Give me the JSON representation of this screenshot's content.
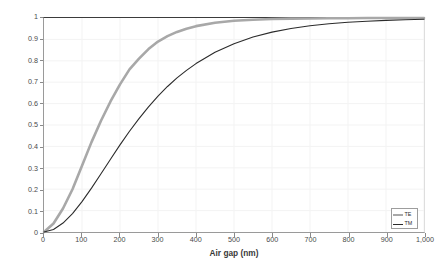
{
  "chart_data": {
    "type": "line",
    "title": "",
    "xlabel": "Air gap (nm)",
    "ylabel": "Reflection coefficient R",
    "xlim": [
      0,
      1000
    ],
    "ylim": [
      0,
      1
    ],
    "grid": true,
    "legend_position": "bottom-right",
    "x_ticks": [
      0,
      100,
      200,
      300,
      400,
      500,
      600,
      700,
      800,
      900,
      1000
    ],
    "x_tick_labels": [
      "0",
      "100",
      "200",
      "300",
      "400",
      "500",
      "600",
      "700",
      "800",
      "900",
      "1,000"
    ],
    "y_ticks": [
      0,
      0.1,
      0.2,
      0.3,
      0.4,
      0.5,
      0.6,
      0.7,
      0.8,
      0.9,
      1
    ],
    "y_tick_labels": [
      "0",
      "0.1",
      "0.2",
      "0.3",
      "0.4",
      "0.5",
      "0.6",
      "0.7",
      "0.8",
      "0.9",
      "1"
    ],
    "x": [
      0,
      25,
      50,
      75,
      100,
      125,
      150,
      175,
      200,
      225,
      250,
      275,
      300,
      325,
      350,
      375,
      400,
      450,
      500,
      550,
      600,
      650,
      700,
      750,
      800,
      850,
      900,
      950,
      1000
    ],
    "series": [
      {
        "name": "TE",
        "color": "#a8a8a8",
        "line_width": 2.6,
        "values": [
          0,
          0.04,
          0.11,
          0.2,
          0.31,
          0.42,
          0.52,
          0.61,
          0.69,
          0.76,
          0.81,
          0.855,
          0.89,
          0.915,
          0.935,
          0.95,
          0.962,
          0.978,
          0.987,
          0.992,
          0.995,
          0.997,
          0.998,
          0.999,
          0.999,
          1,
          1,
          1,
          1
        ]
      },
      {
        "name": "TM",
        "color": "#2b2b2b",
        "line_width": 1.1,
        "values": [
          0,
          0.012,
          0.042,
          0.086,
          0.142,
          0.205,
          0.272,
          0.34,
          0.407,
          0.471,
          0.53,
          0.585,
          0.635,
          0.68,
          0.72,
          0.755,
          0.787,
          0.84,
          0.88,
          0.911,
          0.934,
          0.951,
          0.964,
          0.973,
          0.98,
          0.985,
          0.989,
          0.992,
          0.994
        ]
      }
    ]
  },
  "legend": {
    "entries": [
      {
        "label": "TE"
      },
      {
        "label": "TM"
      }
    ]
  }
}
